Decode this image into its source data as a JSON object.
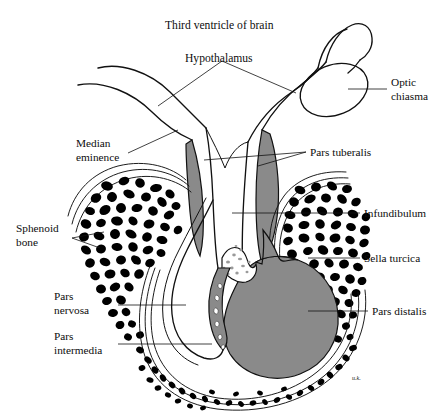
{
  "figure": {
    "signature": "u.k."
  },
  "colors": {
    "background": "#ffffff",
    "ink": "#111111",
    "gray_tissue": "#8a8a8a",
    "bone": "#000000",
    "stipple": "#cfcfcf"
  },
  "labels": {
    "third_ventricle": "Third ventricle of brain",
    "hypothalamus": "Hypothalamus",
    "optic_chiasma_line1": "Optic",
    "optic_chiasma_line2": "chiasma",
    "median_eminence_line1": "Median",
    "median_eminence_line2": "eminence",
    "pars_tuberalis": "Pars tuberalis",
    "sphenoid_bone_line1": "Sphenoid",
    "sphenoid_bone_line2": "bone",
    "infundibulum": "Infundibulum",
    "sella_turcica": "Sella turcica",
    "pars_nervosa_line1": "Pars",
    "pars_nervosa_line2": "nervosa",
    "pars_intermedia_line1": "Pars",
    "pars_intermedia_line2": "intermedia",
    "pars_distalis": "Pars distalis"
  }
}
